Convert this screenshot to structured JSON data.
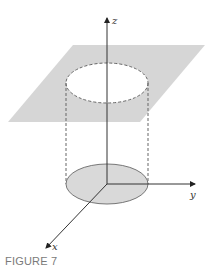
{
  "figure": {
    "caption": "FIGURE 7",
    "axes": {
      "x_label": "x",
      "y_label": "y",
      "z_label": "z"
    },
    "elements": {
      "plane": "horizontal plane (shaded parallelogram)",
      "top_circle": "dashed circle on plane",
      "cylinder_sides": "dashed vertical lines",
      "base_disk": "shaded disk in xy-plane"
    },
    "colors": {
      "plane_fill": "#d6d6d6",
      "disk_fill": "#d9d9d9",
      "disk_stroke": "#777777",
      "axis": "#333333",
      "dashed": "#666666",
      "caption": "#7a7a7a"
    }
  }
}
